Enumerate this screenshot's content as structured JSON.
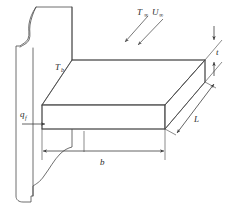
{
  "figure": {
    "name": "rectangular-fin-schematic",
    "background_color": "#ffffff",
    "line_color": "#4a4a4a",
    "text_color": "#2b2b2b"
  },
  "labels": {
    "freestream_temperature": {
      "symbol": "T",
      "subscript": "∞",
      "meaning": "free-stream temperature"
    },
    "freestream_velocity": {
      "symbol": "U",
      "subscript": "∞",
      "meaning": "free-stream velocity"
    },
    "base_temperature": {
      "symbol": "T",
      "subscript": "b",
      "meaning": "fin base temperature"
    },
    "fin_heat_rate": {
      "symbol": "q",
      "subscript": "f",
      "meaning": "fin heat transfer rate"
    },
    "thickness": {
      "symbol": "t",
      "meaning": "fin thickness"
    },
    "length": {
      "symbol": "L",
      "meaning": "fin length (depth)"
    },
    "width": {
      "symbol": "b",
      "meaning": "fin width"
    }
  },
  "annotations": {
    "flow_arrows_count": 2,
    "flow_direction": "down-left",
    "heat_arrow_direction": "right",
    "thickness_arrows": "vertical double",
    "length_arrows": "diagonal double",
    "width_arrows": "horizontal double"
  }
}
